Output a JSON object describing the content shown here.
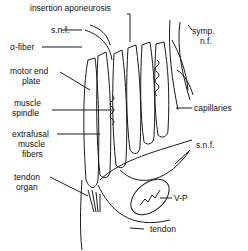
{
  "diagram": {
    "labels": {
      "insertion_aponeurosis": "insertion aponeurosis",
      "snf_top": "s.n.f.",
      "symp_nf_1": "symp.",
      "symp_nf_2": "n.f.",
      "alpha_fiber": "α-fiber",
      "motor_end_plate_1": "motor end",
      "motor_end_plate_2": "plate",
      "muscle_spindle_1": "muscle",
      "muscle_spindle_2": "spindle",
      "capillaries": "capillaries",
      "extrafusal_1": "extrafusal",
      "extrafusal_2": "muscle",
      "extrafusal_3": "fibers",
      "snf_right": "s.n.f.",
      "tendon_organ_1": "tendon",
      "tendon_organ_2": "organ",
      "vp": "V-P",
      "tendon": "tendon"
    }
  }
}
